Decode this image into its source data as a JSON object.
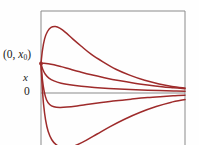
{
  "figure": {
    "title": "",
    "background_color": "#fefefe",
    "width": 199,
    "height": 145
  },
  "labels": {
    "initial_point": {
      "open_paren": "(",
      "t_value": "0",
      "comma": ", ",
      "x_symbol": "x",
      "x_subscript": "0",
      "close_paren": ")"
    },
    "y_axis": "x",
    "origin": "0"
  },
  "colors": {
    "curve": "#9e2b2b",
    "axis": "#8a8a8a",
    "frame": "#8a8a8a",
    "text": "#1a1a1a",
    "background": "#fefefe"
  },
  "chart_data": {
    "type": "line",
    "title": "",
    "xlabel": "",
    "ylabel": "x",
    "xlim": [
      0,
      1
    ],
    "ylim": [
      -1,
      1
    ],
    "grid": false,
    "legend": null,
    "annotations": [
      {
        "text": "(0, x0)",
        "x": 0,
        "y": 0.36,
        "marker": true
      },
      {
        "text": "0",
        "x": 0,
        "y": 0,
        "marker": false
      }
    ],
    "axes": {
      "zero_line_y": 0,
      "frame": [
        "left",
        "top",
        "right"
      ]
    },
    "series": [
      {
        "name": "trajectory-1",
        "points": [
          [
            0.0,
            0.36
          ],
          [
            0.01,
            0.52
          ],
          [
            0.025,
            0.66
          ],
          [
            0.045,
            0.75
          ],
          [
            0.07,
            0.8
          ],
          [
            0.1,
            0.81
          ],
          [
            0.13,
            0.79
          ],
          [
            0.17,
            0.74
          ],
          [
            0.22,
            0.66
          ],
          [
            0.28,
            0.57
          ],
          [
            0.35,
            0.47
          ],
          [
            0.43,
            0.38
          ],
          [
            0.52,
            0.29
          ],
          [
            0.62,
            0.215
          ],
          [
            0.72,
            0.155
          ],
          [
            0.82,
            0.11
          ],
          [
            0.91,
            0.08
          ],
          [
            1.0,
            0.06
          ]
        ]
      },
      {
        "name": "trajectory-2",
        "points": [
          [
            0.0,
            0.36
          ],
          [
            0.02,
            0.362
          ],
          [
            0.05,
            0.358
          ],
          [
            0.09,
            0.345
          ],
          [
            0.14,
            0.322
          ],
          [
            0.2,
            0.292
          ],
          [
            0.27,
            0.258
          ],
          [
            0.35,
            0.222
          ],
          [
            0.44,
            0.187
          ],
          [
            0.54,
            0.152
          ],
          [
            0.64,
            0.122
          ],
          [
            0.74,
            0.098
          ],
          [
            0.84,
            0.077
          ],
          [
            0.92,
            0.064
          ],
          [
            1.0,
            0.052
          ]
        ]
      },
      {
        "name": "trajectory-3",
        "points": [
          [
            0.0,
            0.36
          ],
          [
            0.012,
            0.29
          ],
          [
            0.03,
            0.228
          ],
          [
            0.055,
            0.182
          ],
          [
            0.09,
            0.148
          ],
          [
            0.14,
            0.12
          ],
          [
            0.2,
            0.1
          ],
          [
            0.28,
            0.082
          ],
          [
            0.37,
            0.068
          ],
          [
            0.47,
            0.056
          ],
          [
            0.58,
            0.046
          ],
          [
            0.7,
            0.037
          ],
          [
            0.82,
            0.03
          ],
          [
            0.92,
            0.025
          ],
          [
            1.0,
            0.02
          ]
        ]
      },
      {
        "name": "trajectory-4",
        "points": [
          [
            0.0,
            0.36
          ],
          [
            0.01,
            0.16
          ],
          [
            0.022,
            0.02
          ],
          [
            0.038,
            -0.082
          ],
          [
            0.06,
            -0.14
          ],
          [
            0.09,
            -0.168
          ],
          [
            0.13,
            -0.176
          ],
          [
            0.18,
            -0.172
          ],
          [
            0.25,
            -0.158
          ],
          [
            0.33,
            -0.138
          ],
          [
            0.42,
            -0.116
          ],
          [
            0.52,
            -0.094
          ],
          [
            0.63,
            -0.074
          ],
          [
            0.74,
            -0.056
          ],
          [
            0.85,
            -0.042
          ],
          [
            0.93,
            -0.033
          ],
          [
            1.0,
            -0.026
          ]
        ]
      },
      {
        "name": "trajectory-5",
        "points": [
          [
            0.0,
            0.36
          ],
          [
            0.008,
            0.09
          ],
          [
            0.018,
            -0.14
          ],
          [
            0.032,
            -0.33
          ],
          [
            0.05,
            -0.47
          ],
          [
            0.075,
            -0.57
          ],
          [
            0.105,
            -0.63
          ],
          [
            0.14,
            -0.66
          ],
          [
            0.185,
            -0.665
          ],
          [
            0.24,
            -0.64
          ],
          [
            0.31,
            -0.58
          ],
          [
            0.39,
            -0.5
          ],
          [
            0.48,
            -0.41
          ],
          [
            0.58,
            -0.32
          ],
          [
            0.69,
            -0.235
          ],
          [
            0.8,
            -0.165
          ],
          [
            0.9,
            -0.115
          ],
          [
            1.0,
            -0.08
          ]
        ]
      }
    ]
  }
}
